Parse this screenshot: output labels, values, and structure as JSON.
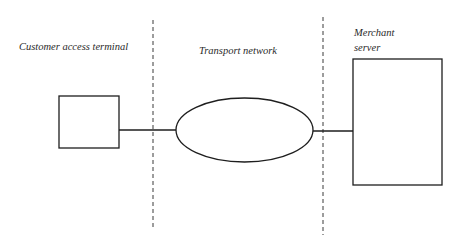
{
  "diagram": {
    "zones": [
      {
        "id": "customer",
        "label": "Customer access terminal"
      },
      {
        "id": "transport",
        "label": "Transport network"
      },
      {
        "id": "merchant",
        "label": "Merchant server"
      }
    ],
    "nodes": [
      {
        "id": "customer-terminal",
        "shape": "rectangle",
        "zone": "customer"
      },
      {
        "id": "transport-network",
        "shape": "ellipse",
        "zone": "transport"
      },
      {
        "id": "merchant-server",
        "shape": "rectangle",
        "zone": "merchant"
      }
    ],
    "edges": [
      {
        "from": "customer-terminal",
        "to": "transport-network",
        "style": "solid"
      },
      {
        "from": "transport-network",
        "to": "merchant-server",
        "style": "solid"
      }
    ],
    "boundaries": [
      {
        "between": [
          "customer",
          "transport"
        ],
        "style": "dashed"
      },
      {
        "between": [
          "transport",
          "merchant"
        ],
        "style": "dashed"
      }
    ],
    "colors": {
      "stroke": "#1e1e1e",
      "dashed": "#3a3a3a",
      "background": "#ffffff"
    }
  }
}
